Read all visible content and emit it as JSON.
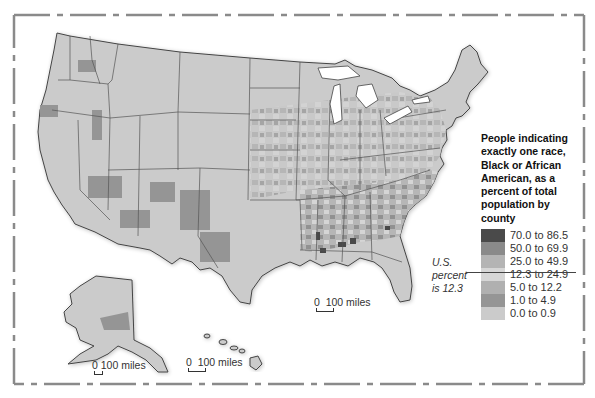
{
  "legend": {
    "title": "People indicating exactly one race, Black or African American, as a percent of total population by county",
    "title_lines": [
      "People indicating",
      "exactly one race,",
      "Black or African",
      "American, as a",
      "percent of total",
      "population by",
      "county"
    ],
    "items": [
      {
        "label": "70.0 to 86.5",
        "color": "#4a4a4a"
      },
      {
        "label": "50.0 to 69.9",
        "color": "#8a8a8a"
      },
      {
        "label": "25.0 to 49.9",
        "color": "#b4b4b4"
      },
      {
        "label": "12.3 to 24.9",
        "color": "#d6d6d6"
      },
      {
        "label": "5.0 to 12.2",
        "color": "#b0b0b0"
      },
      {
        "label": "1.0 to 4.9",
        "color": "#959595"
      },
      {
        "label": "0.0 to 0.9",
        "color": "#cbcbcb"
      }
    ]
  },
  "annotation": {
    "line1": "U.S.",
    "line2": "percent",
    "line3": "is 12.3"
  },
  "scales": {
    "conus": "0  100 miles",
    "alaska": "0 100 miles",
    "hawaii": "0  100 miles"
  },
  "colors": {
    "land": "#cbcbcb",
    "border": "#555555",
    "frame": "#8a8a8a",
    "water": "#ffffff"
  }
}
